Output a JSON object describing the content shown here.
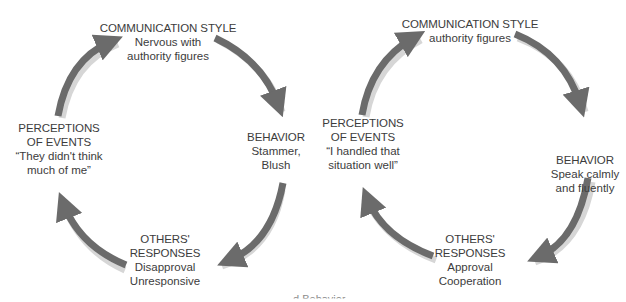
{
  "diagrams": [
    {
      "id": "left",
      "communication_style": {
        "heading": "COMMUNICATION STYLE",
        "lines": [
          "Nervous with",
          "authority figures"
        ]
      },
      "behavior": {
        "heading": "BEHAVIOR",
        "lines": [
          "Stammer,",
          "Blush"
        ]
      },
      "others_responses": {
        "heading": [
          "OTHERS'",
          "RESPONSES"
        ],
        "lines": [
          "Disapproval",
          "Unresponsive"
        ]
      },
      "perceptions": {
        "heading": [
          "PERCEPTIONS",
          "OF EVENTS"
        ],
        "lines": [
          "“They didn't think",
          "much of me”"
        ]
      }
    },
    {
      "id": "right",
      "communication_style": {
        "heading": "COMMUNICATION STYLE",
        "lines": [
          "authority figures"
        ]
      },
      "behavior": {
        "heading": "BEHAVIOR",
        "lines": [
          "Speak calmly",
          "and fluently"
        ]
      },
      "others_responses": {
        "heading": [
          "OTHERS'",
          "RESPONSES"
        ],
        "lines": [
          "Approval",
          "Cooperation"
        ]
      },
      "perceptions": {
        "heading": [
          "PERCEPTIONS",
          "OF EVENTS"
        ],
        "lines": [
          "“I handled that",
          "situation well”"
        ]
      }
    }
  ],
  "caption": "d Behavior",
  "colors": {
    "arrow": "#6b6b6b",
    "arrow_shadow": "#d4d4d4",
    "text": "#3c3c3c"
  }
}
